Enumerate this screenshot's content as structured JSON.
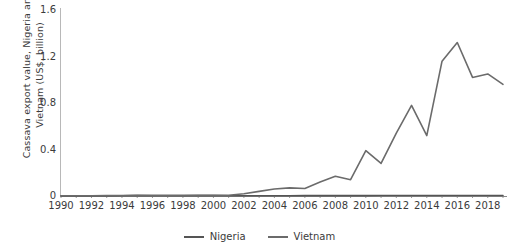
{
  "chart_data": {
    "type": "line",
    "title": "",
    "xlabel": "",
    "ylabel": "Cassava export value, Nigeria and Vietnam (US$, billion)",
    "ylabel_line1": "Cassava export value, Nigeria and",
    "ylabel_line2": "Vietnam (US$, billion)",
    "ylim": [
      0,
      1.6
    ],
    "xlim": [
      1990,
      2019
    ],
    "ytick_labels": [
      "0",
      "0.4",
      "0.8",
      "1.2",
      "1.6"
    ],
    "ytick_values": [
      0,
      0.4,
      0.8,
      1.2,
      1.6
    ],
    "xtick_labels": [
      "1990",
      "1992",
      "1994",
      "1996",
      "1998",
      "2000",
      "2002",
      "2004",
      "2006",
      "2008",
      "2010",
      "2012",
      "2014",
      "2016",
      "2018"
    ],
    "xtick_values": [
      1990,
      1992,
      1994,
      1996,
      1998,
      2000,
      2002,
      2004,
      2006,
      2008,
      2010,
      2012,
      2014,
      2016,
      2018
    ],
    "grid": false,
    "legend_position": "bottom",
    "x": [
      1990,
      1991,
      1992,
      1993,
      1994,
      1995,
      1996,
      1997,
      1998,
      1999,
      2000,
      2001,
      2002,
      2003,
      2004,
      2005,
      2006,
      2007,
      2008,
      2009,
      2010,
      2011,
      2012,
      2013,
      2014,
      2015,
      2016,
      2017,
      2018,
      2019
    ],
    "series": [
      {
        "name": "Nigeria",
        "color": "#555555",
        "values": [
          0.001,
          0.001,
          0.001,
          0.001,
          0.002,
          0.003,
          0.002,
          0.002,
          0.002,
          0.003,
          0.003,
          0.002,
          0.002,
          0.002,
          0.002,
          0.002,
          0.003,
          0.003,
          0.003,
          0.003,
          0.003,
          0.004,
          0.004,
          0.004,
          0.004,
          0.004,
          0.004,
          0.004,
          0.004,
          0.004
        ]
      },
      {
        "name": "Vietnam",
        "color": "#6b6b6b",
        "values": [
          0.002,
          0.002,
          0.002,
          0.003,
          0.004,
          0.005,
          0.005,
          0.005,
          0.005,
          0.006,
          0.006,
          0.007,
          0.02,
          0.04,
          0.06,
          0.07,
          0.065,
          0.12,
          0.17,
          0.14,
          0.39,
          0.28,
          0.54,
          0.78,
          0.52,
          1.16,
          1.32,
          1.02,
          1.05,
          0.96
        ]
      }
    ],
    "annotations": []
  },
  "legend": {
    "items": [
      {
        "label": "Nigeria",
        "color": "#555555"
      },
      {
        "label": "Vietnam",
        "color": "#6b6b6b"
      }
    ]
  },
  "colors": {
    "axis": "#b0b0b0",
    "text": "#3b3b3b",
    "background": "#ffffff"
  }
}
